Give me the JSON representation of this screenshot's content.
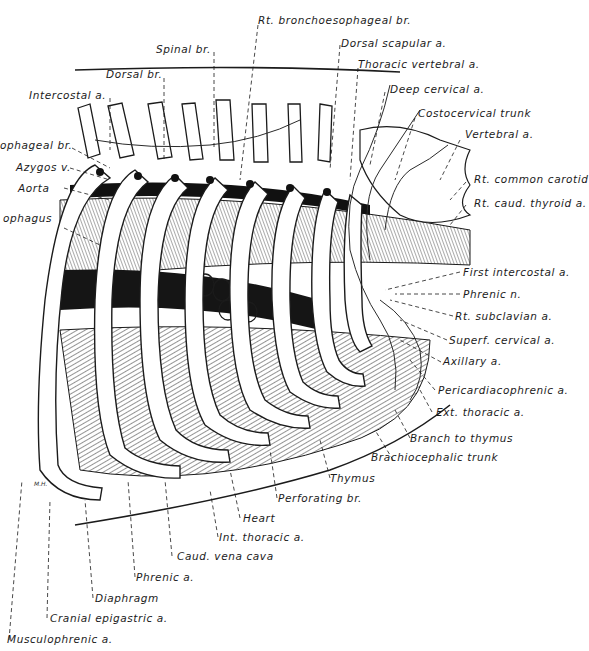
{
  "figure": {
    "artist_initials": "M.H."
  },
  "labels": {
    "rt_bronchoesophageal_br": "Rt. bronchoesophageal br.",
    "spinal_br": "Spinal br.",
    "dorsal_scapular_a": "Dorsal scapular a.",
    "dorsal_br": "Dorsal br.",
    "thoracic_vertebral_a": "Thoracic vertebral a.",
    "intercostal_a": "Intercostal a.",
    "deep_cervical_a": "Deep cervical a.",
    "costocervical_trunk": "Costocervical trunk",
    "esophageal_br": "ophageal br.",
    "vertebral_a": "Vertebral a.",
    "azygos_v": "Azygos v.",
    "rt_common_carotid": "Rt. common carotid",
    "aorta": "Aorta",
    "rt_caud_thyroid_a": "Rt. caud. thyroid a.",
    "esophagus": "ophagus",
    "first_intercostal_a": "First intercostal a.",
    "phrenic_n": "Phrenic n.",
    "rt_subclavian_a": "Rt. subclavian a.",
    "superf_cervical_a": "Superf. cervical a.",
    "axillary_a": "Axillary a.",
    "pericardiacophrenic_a": "Pericardiacophrenic a.",
    "ext_thoracic_a": "Ext. thoracic a.",
    "branch_to_thymus": "Branch to thymus",
    "brachiocephalic_trunk": "Brachiocephalic trunk",
    "thymus": "Thymus",
    "perforating_br": "Perforating br.",
    "heart": "Heart",
    "int_thoracic_a": "Int. thoracic a.",
    "caud_vena_cava": "Caud. vena cava",
    "phrenic_a": "Phrenic a.",
    "diaphragm": "Diaphragm",
    "cranial_epigastric_a": "Cranial epigastric a.",
    "musculophrenic_a": "Musculophrenic a."
  },
  "colors": {
    "ink": "#1b1b1b",
    "paper": "#ffffff",
    "hatch": "#3a3a3a"
  }
}
